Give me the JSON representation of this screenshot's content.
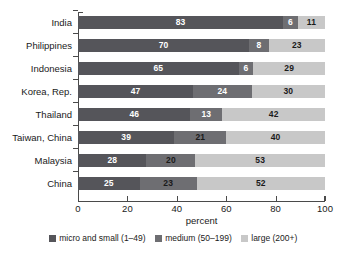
{
  "chart_data": {
    "type": "bar",
    "orientation": "horizontal",
    "stacked": true,
    "title": "",
    "xlabel": "percent",
    "ylabel": "",
    "xlim": [
      0,
      100
    ],
    "xticks": [
      0,
      20,
      40,
      60,
      80,
      100
    ],
    "grid": false,
    "legend_position": "bottom",
    "categories": [
      "India",
      "Philippines",
      "Indonesia",
      "Korea, Rep.",
      "Thailand",
      "Taiwan, China",
      "Malaysia",
      "China"
    ],
    "series": [
      {
        "name": "micro and small (1–49)",
        "color": "#55555a",
        "values": [
          83,
          70,
          65,
          47,
          46,
          39,
          28,
          25
        ]
      },
      {
        "name": "medium (50–199)",
        "color": "#6e6e72",
        "values": [
          6,
          8,
          6,
          24,
          13,
          21,
          20,
          23
        ]
      },
      {
        "name": "large (200+)",
        "color": "#c8c8c8",
        "values": [
          11,
          23,
          29,
          30,
          42,
          40,
          53,
          52
        ]
      }
    ],
    "rows": [
      {
        "category": "India",
        "segments": [
          {
            "value": 83,
            "label": "83",
            "label_color": "light"
          },
          {
            "value": 6,
            "label": "6",
            "label_color": "light"
          },
          {
            "value": 11,
            "label": "11",
            "label_color": "dark"
          }
        ]
      },
      {
        "category": "Philippines",
        "segments": [
          {
            "value": 70,
            "label": "70",
            "label_color": "light"
          },
          {
            "value": 8,
            "label": "8",
            "label_color": "light"
          },
          {
            "value": 23,
            "label": "23",
            "label_color": "dark"
          }
        ]
      },
      {
        "category": "Indonesia",
        "segments": [
          {
            "value": 65,
            "label": "65",
            "label_color": "light"
          },
          {
            "value": 6,
            "label": "6",
            "label_color": "light"
          },
          {
            "value": 29,
            "label": "29",
            "label_color": "dark"
          }
        ]
      },
      {
        "category": "Korea, Rep.",
        "segments": [
          {
            "value": 47,
            "label": "47",
            "label_color": "light"
          },
          {
            "value": 24,
            "label": "24",
            "label_color": "light"
          },
          {
            "value": 30,
            "label": "30",
            "label_color": "dark"
          }
        ]
      },
      {
        "category": "Thailand",
        "segments": [
          {
            "value": 46,
            "label": "46",
            "label_color": "light"
          },
          {
            "value": 13,
            "label": "13",
            "label_color": "light"
          },
          {
            "value": 42,
            "label": "42",
            "label_color": "dark"
          }
        ]
      },
      {
        "category": "Taiwan, China",
        "segments": [
          {
            "value": 39,
            "label": "39",
            "label_color": "light"
          },
          {
            "value": 21,
            "label": "21",
            "label_color": "dark"
          },
          {
            "value": 40,
            "label": "40",
            "label_color": "dark"
          }
        ]
      },
      {
        "category": "Malaysia",
        "segments": [
          {
            "value": 28,
            "label": "28",
            "label_color": "light"
          },
          {
            "value": 20,
            "label": "20",
            "label_color": "dark"
          },
          {
            "value": 53,
            "label": "53",
            "label_color": "dark"
          }
        ]
      },
      {
        "category": "China",
        "segments": [
          {
            "value": 25,
            "label": "25",
            "label_color": "light"
          },
          {
            "value": 23,
            "label": "23",
            "label_color": "dark"
          },
          {
            "value": 52,
            "label": "52",
            "label_color": "dark"
          }
        ]
      }
    ]
  }
}
